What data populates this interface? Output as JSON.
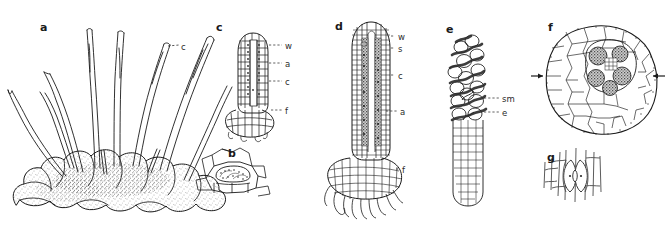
{
  "figure": {
    "background_color": "#ffffff",
    "ink_color": "#1a1a1a",
    "width": 671,
    "height": 230,
    "style": "black-and-white line drawing, scientific botanical plate"
  },
  "panels": [
    {
      "id": "a",
      "letter": "a",
      "name": "habit-of-thallus-with-sporophytes",
      "description": "Lobed rosette thallus bearing numerous elongate erect sporophytes",
      "letter_pos": {
        "x": 40,
        "y": 22
      },
      "labels": [
        {
          "key": "c",
          "text": "c",
          "name": "label-capsule",
          "x": 181,
          "y": 43,
          "leader": "dashed"
        }
      ]
    },
    {
      "id": "b",
      "letter": "b",
      "name": "cell-detail-with-nostoc-cavity",
      "description": "Surface view detail of thallus cells enclosing a dark colony cavity",
      "letter_pos": {
        "x": 228,
        "y": 148
      },
      "labels": []
    },
    {
      "id": "c",
      "letter": "c",
      "name": "young-sporophyte-longitudinal-section",
      "description": "Longitudinal section of a young sporophyte showing wall, archesporium, columella and foot",
      "letter_pos": {
        "x": 216,
        "y": 22
      },
      "labels": [
        {
          "key": "w",
          "text": "w",
          "name": "label-wall",
          "x": 285,
          "y": 42,
          "leader": "dashed"
        },
        {
          "key": "a",
          "text": "a",
          "name": "label-archesporium",
          "x": 285,
          "y": 60,
          "leader": "dashed"
        },
        {
          "key": "c",
          "text": "c",
          "name": "label-columella",
          "x": 285,
          "y": 78,
          "leader": "dashed"
        },
        {
          "key": "f",
          "text": "f",
          "name": "label-foot",
          "x": 285,
          "y": 107,
          "leader": "dashed"
        }
      ]
    },
    {
      "id": "d",
      "letter": "d",
      "name": "mature-sporophyte-longitudinal-section",
      "description": "Longitudinal section of an older sporophyte showing wall, stoma, columella, archesporium and foot with rhizoids",
      "letter_pos": {
        "x": 335,
        "y": 21
      },
      "labels": [
        {
          "key": "w",
          "text": "w",
          "name": "label-wall",
          "x": 398,
          "y": 33,
          "leader": "dashed"
        },
        {
          "key": "s",
          "text": "s",
          "name": "label-stoma",
          "x": 398,
          "y": 45,
          "leader": "dashed"
        },
        {
          "key": "c",
          "text": "c",
          "name": "label-columella",
          "x": 398,
          "y": 72,
          "leader": "dashed"
        },
        {
          "key": "a",
          "text": "a",
          "name": "label-archesporium",
          "x": 400,
          "y": 108,
          "leader": "dashed"
        },
        {
          "key": "f",
          "text": "f",
          "name": "label-foot",
          "x": 402,
          "y": 166,
          "leader": "dashed"
        }
      ]
    },
    {
      "id": "e",
      "letter": "e",
      "name": "columella-with-spores-and-pseudoelaters",
      "description": "Columella bearing spore mother cells and pseudo-elaters",
      "letter_pos": {
        "x": 446,
        "y": 24
      },
      "labels": [
        {
          "key": "sm",
          "text": "sm",
          "name": "label-spore-mother-cell",
          "x": 502,
          "y": 95,
          "leader": "dashed"
        },
        {
          "key": "e",
          "text": "e",
          "name": "label-elater",
          "x": 502,
          "y": 109,
          "leader": "dashed"
        }
      ]
    },
    {
      "id": "f",
      "letter": "f",
      "name": "thallus-cross-section-with-nostoc-colony",
      "description": "Transverse section of the thallus with a central Nostoc colony cavity; arrows mark the cavity level on both sides",
      "letter_pos": {
        "x": 548,
        "y": 22
      },
      "labels": [],
      "arrows": [
        {
          "name": "arrow-left",
          "x1": 531,
          "y1": 76,
          "x2": 546,
          "y2": 76,
          "direction": "right"
        },
        {
          "name": "arrow-right",
          "x1": 665,
          "y1": 76,
          "x2": 650,
          "y2": 76,
          "direction": "left"
        }
      ]
    },
    {
      "id": "g",
      "letter": "g",
      "name": "stoma-surface-view",
      "description": "Surface view of a stoma with two guard cells among elongate epidermal cells",
      "letter_pos": {
        "x": 547,
        "y": 152
      },
      "labels": []
    }
  ],
  "label_glossary": {
    "a": "archesporium",
    "c": "columella / capsule",
    "e": "elater",
    "f": "foot",
    "s": "stoma",
    "sm": "spore mother cell",
    "w": "wall"
  }
}
